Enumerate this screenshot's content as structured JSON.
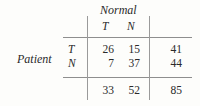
{
  "figure": {
    "type": "contingency-table",
    "row_group_label": "Patient",
    "column_group_label": "Normal",
    "column_headers": [
      "T",
      "N"
    ],
    "row_headers": [
      "T",
      "N"
    ],
    "cells": [
      [
        "26",
        "15"
      ],
      [
        "7",
        "37"
      ]
    ],
    "row_totals": [
      "41",
      "44"
    ],
    "column_totals": [
      "33",
      "52"
    ],
    "grand_total": "85",
    "colors": {
      "background": "#fdfdfb",
      "text": "#2a2a2a",
      "rule": "#8e8e8e"
    }
  },
  "chart_data": {
    "type": "table",
    "title": "",
    "xlabel": "Normal",
    "ylabel": "Patient",
    "categories": [
      "T",
      "N"
    ],
    "row_categories": [
      "T",
      "N"
    ],
    "values": [
      [
        26,
        15
      ],
      [
        7,
        37
      ]
    ],
    "row_totals": [
      41,
      44
    ],
    "column_totals": [
      33,
      52
    ],
    "grand_total": 85,
    "grid": false,
    "legend": "none"
  }
}
